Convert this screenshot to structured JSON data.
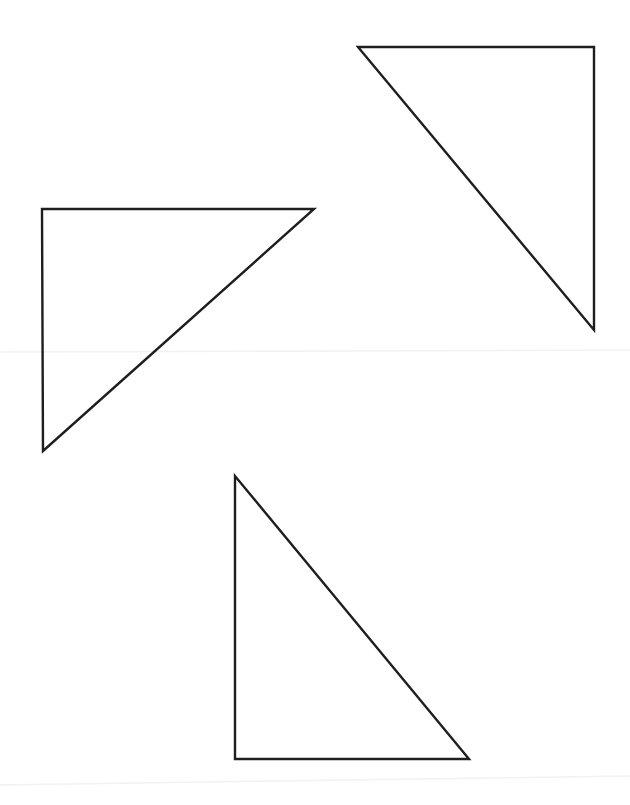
{
  "canvas": {
    "width": 630,
    "height": 805,
    "background": "#ffffff"
  },
  "style": {
    "stroke": "#1e1e1e",
    "stroke_width": 2.4
  },
  "triangles": [
    {
      "name": "triangle-top-right",
      "orientation": "right angle at top-right",
      "points": [
        [
          358,
          47
        ],
        [
          594,
          47
        ],
        [
          594,
          330
        ]
      ]
    },
    {
      "name": "triangle-left",
      "orientation": "right angle at top-left",
      "points": [
        [
          42,
          209
        ],
        [
          314,
          209
        ],
        [
          43,
          451
        ]
      ]
    },
    {
      "name": "triangle-bottom",
      "orientation": "right angle at bottom-left",
      "points": [
        [
          235,
          476
        ],
        [
          235,
          759
        ],
        [
          469,
          759
        ]
      ]
    }
  ]
}
